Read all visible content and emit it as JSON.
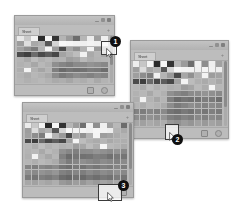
{
  "page": {
    "background_color": "#ffffff",
    "width": 237,
    "height": 213
  },
  "palette": {
    "window_body": "#b9b9b9",
    "window_border": "#9a9a9a",
    "titlebar": "#c3c3c3",
    "tabbar": "#bdbdbd",
    "statusbar": "#bcbcbc",
    "scrollbar_track": "#ababab",
    "scrollbar_thumb": "#8b8b8b",
    "callout_badge": "#101010",
    "callout_badge_text": "#ffffff",
    "callout_box_border": "#3a3a3a"
  },
  "windows": [
    {
      "id": "window-1",
      "order_label": "1",
      "tab_label": "Sheet",
      "add_tab_label": "+",
      "controls": [
        "minimize",
        "maximize",
        "close"
      ],
      "status_icons": [
        "grid-view-icon",
        "zoom-icon"
      ],
      "scroll_thumb_percent": 62,
      "bounds": {
        "x": 14,
        "y": 15,
        "width": 99,
        "height": 79
      },
      "grid": {
        "columns": 13,
        "rows": 9,
        "cell_values": [
          [
            "#e8e8e8",
            "#c9c9c9",
            "#f2f2f2",
            "#2b2b2b",
            "#f6f6f6",
            "#343434",
            "#b4b4b4",
            "#9a9a9a",
            "#6d6d6d",
            "#b6b6b6",
            "#ededed",
            "#9f9f9f",
            "#efefef"
          ],
          [
            "#9d9d9d",
            "#dedede",
            "#a8a8a8",
            "#b1b1b1",
            "#585858",
            "#d3d3d3",
            "#f7f7f7",
            "#f4f4f4",
            "#f1f1f1",
            "#efefef",
            "#f3f3f3",
            "#f0f0f0",
            "#ececec"
          ],
          [
            "#a0a0a0",
            "#8e8e8e",
            "#7b7b7b",
            "#b3b3b3",
            "#f3f3f3",
            "#9a9a9a",
            "#4b4b4b",
            "#a6a6a6",
            "#8f8f8f",
            "#b2b2b2",
            "#f2f2f2",
            "#9b9b9b",
            "#a3a3a3"
          ],
          [
            "#4d4d4d",
            "#3f3f3f",
            "#6c6c6c",
            "#4a4a4a",
            "#5c5c5c",
            "#474747",
            "#a3a3a3",
            "#b0b0b0",
            "#bdbdbd",
            "#f1f1f1",
            "#a9a9a9",
            "#b5b5b5",
            "#a7a7a7"
          ],
          [
            "#b4b4b4",
            "#a9a9a9",
            "#bcbcbc",
            "#b0b0b0",
            "#b7b7b7",
            "#aeaeae",
            "#b2b2b2",
            "#9e9e9e",
            "#a4a4a4",
            "#b9b9b9",
            "#adadad",
            "#b3b3b3",
            "#b6b6b6"
          ],
          [
            "#b1b1b1",
            "#b6b6b6",
            "#a7a7a7",
            "#b8b8b8",
            "#b0b0b0",
            "#8f8f8f",
            "#858585",
            "#7e7e7e",
            "#8a8a8a",
            "#8b8b8b",
            "#939393",
            "#8e8e8e",
            "#888888"
          ],
          [
            "#aeaeae",
            "#f4f4f4",
            "#b2b2b2",
            "#a5a5a5",
            "#b4b4b4",
            "#7f7f7f",
            "#6a6a6a",
            "#747474",
            "#6f6f6f",
            "#727272",
            "#7c7c7c",
            "#797979",
            "#6e6e6e"
          ],
          [
            "#b3b3b3",
            "#acacac",
            "#b7b7b7",
            "#b1b1b1",
            "#a9a9a9",
            "#8c8c8c",
            "#7a7a7a",
            "#838383",
            "#8d8d8d",
            "#878787",
            "#818181",
            "#8a8a8a",
            "#858585"
          ],
          [
            "#b6b6b6",
            "#b0b0b0",
            "#b4b4b4",
            "#b8b8b8",
            "#b2b2b2",
            "#aaaaaa",
            "#aeaeae",
            "#a6a6a6",
            "#b1b1b1",
            "#adadad",
            "#b5b5b5",
            "#a9a9a9",
            "#b3b3b3"
          ]
        ]
      }
    },
    {
      "id": "window-2",
      "order_label": "2",
      "tab_label": "Sheet",
      "add_tab_label": "+",
      "controls": [
        "minimize",
        "maximize",
        "close"
      ],
      "status_icons": [
        "grid-view-icon",
        "zoom-icon"
      ],
      "scroll_thumb_percent": 70,
      "bounds": {
        "x": 130,
        "y": 40,
        "width": 97,
        "height": 97
      },
      "grid": {
        "columns": 13,
        "rows": 11,
        "cell_values": [
          [
            "#ededed",
            "#c6c6c6",
            "#f4f4f4",
            "#2a2a2a",
            "#f5f5f5",
            "#333333",
            "#b6b6b6",
            "#9b9b9b",
            "#6e6e6e",
            "#f0f0f0",
            "#8d8d8d",
            "#efefef",
            "#a1a1a1"
          ],
          [
            "#9e9e9e",
            "#dcdcdc",
            "#a6a6a6",
            "#b2b2b2",
            "#565656",
            "#d5d5d5",
            "#f6f6f6",
            "#f3f3f3",
            "#f2f2f2",
            "#eeeeee",
            "#f4f4f4",
            "#f1f1f1",
            "#ededed"
          ],
          [
            "#9f9f9f",
            "#8d8d8d",
            "#7c7c7c",
            "#f2f2f2",
            "#b4b4b4",
            "#999999",
            "#4a4a4a",
            "#a7a7a7",
            "#909090",
            "#b1b1b1",
            "#f3f3f3",
            "#9c9c9c",
            "#a2a2a2"
          ],
          [
            "#4c4c4c",
            "#3e3e3e",
            "#6b6b6b",
            "#494949",
            "#5d5d5d",
            "#484848",
            "#a2a2a2",
            "#f4f4f4",
            "#bcbcbc",
            "#b0b0b0",
            "#aaaaaa",
            "#b4b4b4",
            "#a8a8a8"
          ],
          [
            "#b5b5b5",
            "#aaaaaa",
            "#bdbdbd",
            "#b1b1b1",
            "#b8b8b8",
            "#afafaf",
            "#b3b3b3",
            "#9d9d9d",
            "#a5a5a5",
            "#bababa",
            "#acacac",
            "#f5f5f5",
            "#b7b7b7"
          ],
          [
            "#b2b2b2",
            "#b7b7b7",
            "#a8a8a8",
            "#b9b9b9",
            "#b1b1b1",
            "#909090",
            "#868686",
            "#7f7f7f",
            "#8b8b8b",
            "#8c8c8c",
            "#949494",
            "#8f8f8f",
            "#898989"
          ],
          [
            "#afafaf",
            "#f3f3f3",
            "#b3b3b3",
            "#a6a6a6",
            "#b5b5b5",
            "#808080",
            "#6b6b6b",
            "#757575",
            "#707070",
            "#737373",
            "#7d7d7d",
            "#7a7a7a",
            "#6f6f6f"
          ],
          [
            "#b4b4b4",
            "#adadad",
            "#b8b8b8",
            "#b2b2b2",
            "#aaaaaa",
            "#8d8d8d",
            "#7b7b7b",
            "#848484",
            "#8e8e8e",
            "#888888",
            "#828282",
            "#8b8b8b",
            "#868686"
          ],
          [
            "#838383",
            "#7d7d7d",
            "#878787",
            "#818181",
            "#8a8a8a",
            "#757575",
            "#6e6e6e",
            "#797979",
            "#727272",
            "#7e7e7e",
            "#767676",
            "#808080",
            "#7a7a7a"
          ],
          [
            "#8e8e8e",
            "#888888",
            "#929292",
            "#8c8c8c",
            "#959595",
            "#808080",
            "#797979",
            "#848484",
            "#7d7d7d",
            "#898989",
            "#818181",
            "#8b8b8b",
            "#858585"
          ],
          [
            "#a6a6a6",
            "#a0a0a0",
            "#aaaaaa",
            "#a4a4a4",
            "#adadad",
            "#989898",
            "#919191",
            "#9c9c9c",
            "#959595",
            "#a1a1a1",
            "#999999",
            "#a3a3a3",
            "#9d9d9d"
          ]
        ]
      }
    },
    {
      "id": "window-3",
      "order_label": "3",
      "tab_label": "Sheet",
      "add_tab_label": "+",
      "controls": [
        "minimize",
        "maximize",
        "close"
      ],
      "status_icons": [
        "grid-view-icon"
      ],
      "scroll_thumb_percent": 74,
      "bounds": {
        "x": 22,
        "y": 102,
        "width": 110,
        "height": 94
      },
      "grid": {
        "columns": 15,
        "rows": 12,
        "cell_values": [
          [
            "#ebebeb",
            "#c8c8c8",
            "#f3f3f3",
            "#292929",
            "#f6f6f6",
            "#323232",
            "#b5b5b5",
            "#9c9c9c",
            "#6f6f6f",
            "#efefef",
            "#8e8e8e",
            "#f0f0f0",
            "#a0a0a0",
            "#b8b8b8",
            "#6c6c6c"
          ],
          [
            "#9d9d9d",
            "#dddddd",
            "#a7a7a7",
            "#b3b3b3",
            "#575757",
            "#d4d4d4",
            "#f7f7f7",
            "#f2f2f2",
            "#f3f3f3",
            "#efefef",
            "#f5f5f5",
            "#f2f2f2",
            "#eeeeee",
            "#b2b2b2",
            "#a9a9a9"
          ],
          [
            "#a0a0a0",
            "#8e8e8e",
            "#7d7d7d",
            "#f1f1f1",
            "#b5b5b5",
            "#9a9a9a",
            "#4b4b4b",
            "#a8a8a8",
            "#919191",
            "#b2b2b2",
            "#f4f4f4",
            "#9d9d9d",
            "#a3a3a3",
            "#acacac",
            "#b4b4b4"
          ],
          [
            "#4b4b4b",
            "#3d3d3d",
            "#6a6a6a",
            "#484848",
            "#5e5e5e",
            "#474747",
            "#a3a3a3",
            "#f5f5f5",
            "#bdbdbd",
            "#b1b1b1",
            "#ababab",
            "#b5b5b5",
            "#a9a9a9",
            "#b0b0b0",
            "#aeaeae"
          ],
          [
            "#b6b6b6",
            "#ababab",
            "#bebebe",
            "#b2b2b2",
            "#b9b9b9",
            "#b0b0b0",
            "#b4b4b4",
            "#9e9e9e",
            "#a6a6a6",
            "#bbbbbb",
            "#adadad",
            "#f6f6f6",
            "#b8b8b8",
            "#b3b3b3",
            "#aaaaaa"
          ],
          [
            "#b3b3b3",
            "#b8b8b8",
            "#a9a9a9",
            "#bababa",
            "#b2b2b2",
            "#919191",
            "#878787",
            "#808080",
            "#8c8c8c",
            "#8d8d8d",
            "#959595",
            "#909090",
            "#8a8a8a",
            "#939393",
            "#888888"
          ],
          [
            "#b0b0b0",
            "#f2f2f2",
            "#b4b4b4",
            "#a7a7a7",
            "#b6b6b6",
            "#818181",
            "#6c6c6c",
            "#767676",
            "#717171",
            "#747474",
            "#7e7e7e",
            "#7b7b7b",
            "#707070",
            "#797979",
            "#757575"
          ],
          [
            "#b5b5b5",
            "#aeaeae",
            "#b9b9b9",
            "#b3b3b3",
            "#ababab",
            "#8e8e8e",
            "#7c7c7c",
            "#858585",
            "#8f8f8f",
            "#898989",
            "#838383",
            "#8c8c8c",
            "#878787",
            "#818181",
            "#8a8a8a"
          ],
          [
            "#848484",
            "#7e7e7e",
            "#888888",
            "#828282",
            "#8b8b8b",
            "#767676",
            "#6f6f6f",
            "#7a7a7a",
            "#737373",
            "#7f7f7f",
            "#777777",
            "#818181",
            "#7b7b7b",
            "#858585",
            "#7d7d7d"
          ],
          [
            "#8f8f8f",
            "#898989",
            "#939393",
            "#8d8d8d",
            "#969696",
            "#818181",
            "#7a7a7a",
            "#858585",
            "#7e7e7e",
            "#8a8a8a",
            "#828282",
            "#8c8c8c",
            "#868686",
            "#909090",
            "#888888"
          ],
          [
            "#7b7b7b",
            "#757575",
            "#7f7f7f",
            "#797979",
            "#828282",
            "#6d6d6d",
            "#666666",
            "#717171",
            "#6a6a6a",
            "#767676",
            "#6e6e6e",
            "#787878",
            "#727272",
            "#7c7c7c",
            "#747474"
          ],
          [
            "#a7a7a7",
            "#a1a1a1",
            "#ababab",
            "#a5a5a5",
            "#aeaeae",
            "#999999",
            "#929292",
            "#9d9d9d",
            "#969696",
            "#a2a2a2",
            "#9a9a9a",
            "#a4a4a4",
            "#9e9e9e",
            "#a8a8a8",
            "#a0a0a0"
          ]
        ]
      }
    }
  ],
  "callouts": [
    {
      "id": "callout-1",
      "number": "1",
      "target": "cell-selection-cursor",
      "cursor_icon": "arrow-cursor-icon",
      "box": {
        "x": 101,
        "y": 41,
        "width": 14,
        "height": 12
      },
      "badge": {
        "x": 110,
        "y": 36
      }
    },
    {
      "id": "callout-2",
      "number": "2",
      "target": "statusbar-cursor",
      "cursor_icon": "arrow-cursor-icon",
      "box": {
        "x": 165,
        "y": 124,
        "width": 12,
        "height": 14
      },
      "badge": {
        "x": 172,
        "y": 134
      }
    },
    {
      "id": "callout-3",
      "number": "3",
      "target": "resize-handle-cursor",
      "cursor_icon": "arrow-cursor-icon",
      "box": {
        "x": 98,
        "y": 184,
        "width": 22,
        "height": 15
      },
      "badge": {
        "x": 118,
        "y": 180
      }
    }
  ]
}
